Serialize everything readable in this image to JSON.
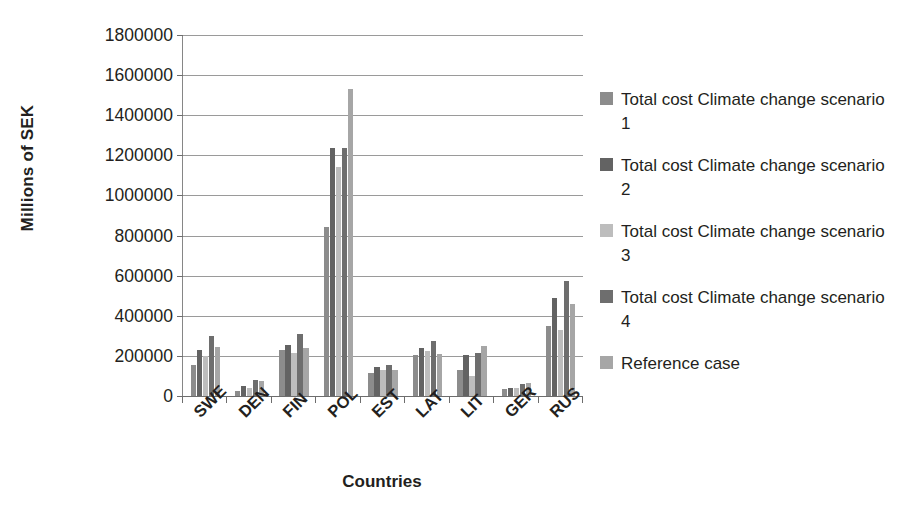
{
  "chart_data": {
    "type": "bar",
    "title": "",
    "xlabel": "Countries",
    "ylabel": "Millions of SEK",
    "ylim": [
      0,
      1800000
    ],
    "ytick_step": 200000,
    "ytick_labels": [
      "1800000",
      "1600000",
      "1400000",
      "1200000",
      "1000000",
      "800000",
      "600000",
      "400000",
      "200000",
      "0"
    ],
    "grid": true,
    "legend_position": "right",
    "categories": [
      "SWE",
      "DEN",
      "FIN",
      "POL",
      "EST",
      "LAT",
      "LIT",
      "GER",
      "RUS"
    ],
    "series": [
      {
        "name": "Total cost Climate change scenario 1",
        "color": "#8c8c8c",
        "values": [
          155000,
          25000,
          230000,
          845000,
          115000,
          205000,
          130000,
          35000,
          350000
        ]
      },
      {
        "name": "Total cost Climate change scenario 2",
        "color": "#636363",
        "values": [
          230000,
          50000,
          255000,
          1235000,
          145000,
          240000,
          205000,
          40000,
          490000
        ]
      },
      {
        "name": "Total cost Climate change scenario 3",
        "color": "#bdbdbd",
        "values": [
          200000,
          40000,
          215000,
          1140000,
          130000,
          225000,
          100000,
          38000,
          330000
        ]
      },
      {
        "name": "Total cost Climate change scenario 4",
        "color": "#6e6e6e",
        "values": [
          300000,
          80000,
          310000,
          1235000,
          155000,
          275000,
          215000,
          60000,
          575000
        ]
      },
      {
        "name": "Reference case",
        "color": "#a6a6a6",
        "values": [
          245000,
          75000,
          240000,
          1530000,
          130000,
          210000,
          250000,
          65000,
          460000
        ]
      }
    ]
  },
  "legend": {
    "items": [
      {
        "label": "Total cost Climate change scenario 1"
      },
      {
        "label": "Total cost Climate change scenario 2"
      },
      {
        "label": "Total cost Climate change scenario 3"
      },
      {
        "label": "Total cost Climate change scenario 4"
      },
      {
        "label": "Reference case"
      }
    ]
  }
}
